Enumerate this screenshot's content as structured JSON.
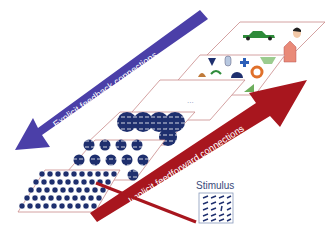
{
  "diagram": {
    "title": "",
    "colors": {
      "feedback_arrow": "#4b3fa8",
      "feedforward_arrow": "#a8161e",
      "layer_border": "#c98a8a",
      "unit_fill": "#1e2f6e"
    },
    "layers": [
      {
        "id": "layer-1",
        "label": "",
        "content": "small oriented-bar units (edge detectors)"
      },
      {
        "id": "layer-2",
        "label": "",
        "content": "medium units"
      },
      {
        "id": "layer-3",
        "label": "",
        "content": "large overlapping units"
      },
      {
        "id": "layer-4",
        "label": "...",
        "content": "intermediate layers (ellipsis)"
      },
      {
        "id": "layer-5",
        "label": "",
        "content": "shape parts (triangle, cylinder, cross, trapezoid, arch, semicircle, ring)"
      },
      {
        "id": "layer-6",
        "label": "",
        "content": "objects (car, face, house)"
      }
    ],
    "arrows": [
      {
        "id": "feedback",
        "label": "Explicit feedback connections",
        "direction": "top-to-bottom"
      },
      {
        "id": "feedforward",
        "label": "Implicit feedforward connections",
        "direction": "bottom-to-top"
      }
    ],
    "stimulus": {
      "label": "Stimulus"
    },
    "ellipsis": "..."
  }
}
